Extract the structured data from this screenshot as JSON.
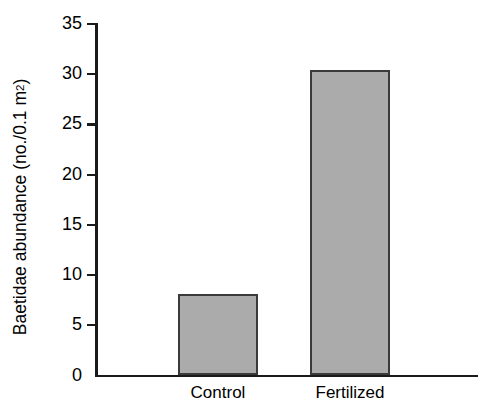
{
  "chart_data": {
    "type": "bar",
    "title": "",
    "xlabel": "",
    "ylabel": "Baetidae abundance (no./0.1 m2)",
    "ylabel_prefix": "Baetidae abundance (no./0.1 m",
    "ylabel_superscript": "2",
    "ylabel_suffix": ")",
    "categories": [
      "Control",
      "Fertilized"
    ],
    "values": [
      8.1,
      30.4
    ],
    "ylim": [
      0,
      35
    ],
    "ytick_values": [
      0,
      5,
      10,
      15,
      20,
      25,
      30,
      35
    ],
    "ytick_labels": [
      "0",
      "5",
      "10",
      "15",
      "20",
      "25",
      "30",
      "35"
    ],
    "grid": false,
    "legend": false,
    "bar_fill_color": "#ababab",
    "bar_edge_color": "#3a3a3a",
    "axis_color": "#1a1a1a",
    "background_color": "#ffffff"
  }
}
